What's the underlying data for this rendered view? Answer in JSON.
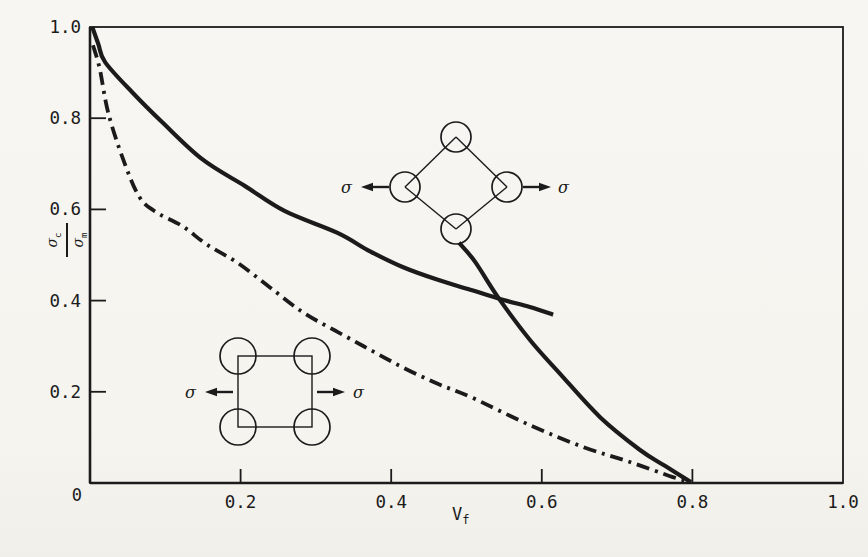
{
  "figure": {
    "background": "#f6f5f1",
    "ink": "#1b1b1b"
  },
  "labels": {
    "sigma": "σ",
    "sub_c": "c",
    "sub_m": "m",
    "v": "V",
    "sub_f": "f",
    "origin": "0"
  },
  "chart_data": {
    "type": "line",
    "title": "",
    "xlabel": "V_f",
    "ylabel": "σ_c/σ_m",
    "xlim": [
      0,
      1.0
    ],
    "ylim": [
      0,
      1.0
    ],
    "grid": false,
    "legend_position": "none",
    "x_tick_values": [
      0.2,
      0.4,
      0.6,
      0.8
    ],
    "y_tick_values": [
      0.2,
      0.4,
      0.6,
      0.8
    ],
    "x_tick_labels": [
      {
        "v": 0.2,
        "t": "0.2"
      },
      {
        "v": 0.4,
        "t": "0.4"
      },
      {
        "v": 0.6,
        "t": "0.6"
      },
      {
        "v": 0.8,
        "t": "0.8"
      },
      {
        "v": 1.0,
        "t": "1.0"
      }
    ],
    "y_tick_labels": [
      {
        "v": 0.2,
        "t": "0.2"
      },
      {
        "v": 0.4,
        "t": "0.4"
      },
      {
        "v": 0.6,
        "t": "0.6"
      },
      {
        "v": 0.8,
        "t": "0.8"
      },
      {
        "v": 1.0,
        "t": "1.0"
      }
    ],
    "series": [
      {
        "name": "upper-solid-curve",
        "style": "solid",
        "width": 4.2,
        "x": [
          0.003,
          0.011,
          0.02,
          0.056,
          0.096,
          0.149,
          0.206,
          0.259,
          0.328,
          0.372,
          0.416,
          0.461,
          0.505,
          0.548,
          0.584,
          0.615
        ],
        "y": [
          1.0,
          0.963,
          0.923,
          0.857,
          0.791,
          0.71,
          0.651,
          0.596,
          0.549,
          0.508,
          0.473,
          0.446,
          0.424,
          0.402,
          0.386,
          0.369
        ]
      },
      {
        "name": "diamond-array-branch-curve",
        "style": "solid",
        "width": 4.2,
        "x": [
          0.49,
          0.511,
          0.542,
          0.584,
          0.624,
          0.677,
          0.73,
          0.764,
          0.798
        ],
        "y": [
          0.527,
          0.486,
          0.407,
          0.314,
          0.24,
          0.145,
          0.073,
          0.037,
          0.002
        ]
      },
      {
        "name": "dash-dot-curve",
        "style": "dash-dot",
        "width": 3.8,
        "x": [
          0.004,
          0.013,
          0.024,
          0.044,
          0.066,
          0.09,
          0.123,
          0.155,
          0.195,
          0.239,
          0.283,
          0.328,
          0.372,
          0.416,
          0.461,
          0.505,
          0.584,
          0.655,
          0.717,
          0.774,
          0.798
        ],
        "y": [
          0.96,
          0.908,
          0.813,
          0.71,
          0.626,
          0.592,
          0.563,
          0.523,
          0.484,
          0.429,
          0.374,
          0.332,
          0.292,
          0.253,
          0.218,
          0.189,
          0.127,
          0.079,
          0.046,
          0.013,
          0.002
        ]
      }
    ],
    "annotations": {
      "diamond_inset": {
        "name": "diamond-fiber-array-inset",
        "vertices_px": [
          [
            456,
            137
          ],
          [
            507,
            187
          ],
          [
            456,
            229
          ],
          [
            405,
            187
          ]
        ],
        "circle_r": 15,
        "arrows": [
          {
            "tail": [
              389,
              187
            ],
            "tip": [
              361,
              187
            ]
          },
          {
            "tail": [
              523,
              187
            ],
            "tip": [
              551,
              187
            ]
          }
        ],
        "sigma_labels": [
          {
            "x": 352,
            "y": 187,
            "anchor": "end",
            "text": "σ"
          },
          {
            "x": 558,
            "y": 187,
            "anchor": "start",
            "text": "σ"
          }
        ]
      },
      "square_inset": {
        "name": "square-fiber-array-inset",
        "square_px": [
          238,
          356,
          312,
          427
        ],
        "circle_r": 18,
        "arrows": [
          {
            "tail": [
              233,
              392
            ],
            "tip": [
              205,
              392
            ]
          },
          {
            "tail": [
              317,
              392
            ],
            "tip": [
              345,
              392
            ]
          }
        ],
        "sigma_labels": [
          {
            "x": 196,
            "y": 392,
            "anchor": "end",
            "text": "σ"
          },
          {
            "x": 353,
            "y": 392,
            "anchor": "start",
            "text": "σ"
          }
        ]
      }
    }
  }
}
